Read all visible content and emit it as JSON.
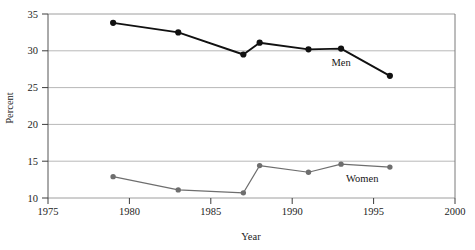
{
  "chart_data": {
    "type": "line",
    "title": "",
    "xlabel": "Year",
    "ylabel": "Percent",
    "xlim": [
      1975,
      2000
    ],
    "ylim": [
      10,
      35
    ],
    "xticks": [
      1975,
      1980,
      1985,
      1990,
      1995,
      2000
    ],
    "yticks": [
      10,
      15,
      20,
      25,
      30,
      35
    ],
    "xtick_labels": [
      "1975",
      "1980",
      "1985",
      "1990",
      "1995",
      "2000"
    ],
    "ytick_labels": [
      "10",
      "15",
      "20",
      "25",
      "30",
      "35"
    ],
    "grid": true,
    "grid_axis": "y",
    "legend_position": "inline-annotation",
    "series": [
      {
        "name": "Men",
        "color": "#111111",
        "marker": "circle",
        "x": [
          1979,
          1983,
          1987,
          1988,
          1991,
          1993,
          1996
        ],
        "values": [
          33.8,
          32.5,
          29.5,
          31.1,
          30.2,
          30.3,
          26.6
        ]
      },
      {
        "name": "Women",
        "color": "#6e6e6e",
        "marker": "circle",
        "x": [
          1979,
          1983,
          1987,
          1988,
          1991,
          1993,
          1996
        ],
        "values": [
          12.9,
          11.1,
          10.7,
          14.4,
          13.5,
          14.6,
          14.2
        ]
      }
    ],
    "annotations": [
      {
        "text": "Men",
        "x": 1993.0,
        "y": 28.0
      },
      {
        "text": "Women",
        "x": 1994.3,
        "y": 12.2
      }
    ]
  },
  "axes": {
    "ylabel": "Percent",
    "xlabel": "Year",
    "ytick_labels": [
      "35",
      "30",
      "25",
      "20",
      "15",
      "10"
    ],
    "xtick_labels": [
      "1975",
      "1980",
      "1985",
      "1990",
      "1995",
      "2000"
    ]
  },
  "labels": {
    "men": "Men",
    "women": "Women"
  },
  "colors": {
    "men_line": "#111111",
    "women_line": "#6e6e6e",
    "gridline": "#b2b2b2",
    "axis": "#4a4a4a",
    "background": "#ffffff"
  }
}
